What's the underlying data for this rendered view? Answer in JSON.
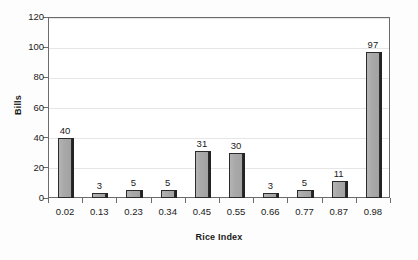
{
  "chart_data": {
    "type": "bar",
    "title": "",
    "subtitle": "",
    "xlabel": "Rice Index",
    "ylabel": "Bills",
    "categories": [
      "0.02",
      "0.13",
      "0.23",
      "0.34",
      "0.45",
      "0.55",
      "0.66",
      "0.77",
      "0.87",
      "0.98"
    ],
    "values": [
      40,
      3,
      5,
      5,
      31,
      30,
      3,
      5,
      11,
      97
    ],
    "data_labels": [
      "40",
      "3",
      "5",
      "5",
      "31",
      "30",
      "3",
      "5",
      "11",
      "97"
    ],
    "ylim": [
      0,
      120
    ],
    "y_ticks": [
      0,
      20,
      40,
      60,
      80,
      100,
      120
    ],
    "y_tick_labels": [
      "0",
      "20",
      "40",
      "60",
      "80",
      "100",
      "120"
    ],
    "grid": true,
    "grid_axis": "y",
    "legend": false,
    "legend_position": "none",
    "bar_color": "#a9a9a9",
    "bar_border_color": "#2b2b2b",
    "gridline_color": "#e6e6e6",
    "axis_color": "#6b6b6b",
    "text_color": "#1a1a1a",
    "background_color": "#fdfdfd",
    "plot_background_color": "#ffffff"
  }
}
